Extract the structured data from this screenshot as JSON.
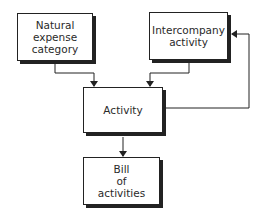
{
  "diagram": {
    "nodes": [
      {
        "id": "natural",
        "lines": [
          "Natural",
          "expense",
          "category"
        ]
      },
      {
        "id": "intercompany",
        "lines": [
          "Intercompany",
          "activity"
        ]
      },
      {
        "id": "activity",
        "lines": [
          "Activity"
        ]
      },
      {
        "id": "bill",
        "lines": [
          "Bill",
          "of",
          "activities"
        ]
      }
    ],
    "edges": [
      {
        "from": "natural",
        "to": "activity"
      },
      {
        "from": "intercompany",
        "to": "activity"
      },
      {
        "from": "activity",
        "to": "bill"
      },
      {
        "from": "activity",
        "to": "intercompany"
      }
    ]
  }
}
